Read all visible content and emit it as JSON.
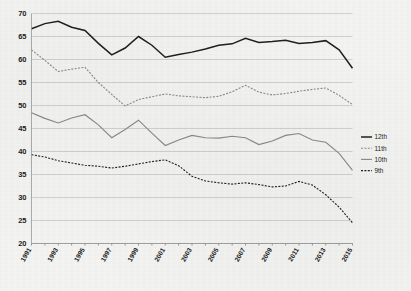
{
  "chart_data": {
    "type": "line",
    "title": "",
    "subtitle": "",
    "xlabel": "",
    "ylabel": "",
    "xlim": [
      1991,
      2015
    ],
    "ylim": [
      20,
      70
    ],
    "yticks": [
      20,
      25,
      30,
      35,
      40,
      45,
      50,
      55,
      60,
      65,
      70
    ],
    "grid": true,
    "legend_position": "right",
    "x": [
      1991,
      1992,
      1993,
      1994,
      1995,
      1996,
      1997,
      1998,
      1999,
      2000,
      2001,
      2002,
      2003,
      2004,
      2005,
      2006,
      2007,
      2008,
      2009,
      2010,
      2011,
      2012,
      2013,
      2014,
      2015
    ],
    "xtick_labels": [
      "1991",
      "1993",
      "1995",
      "1997",
      "1999",
      "2001",
      "2003",
      "2005",
      "2007",
      "2009",
      "2011",
      "2013",
      "2015"
    ],
    "xticks": [
      1991,
      1993,
      1995,
      1997,
      1999,
      2001,
      2003,
      2005,
      2007,
      2009,
      2011,
      2013,
      2015
    ],
    "series": [
      {
        "name": "12th",
        "style": "solid",
        "color": "#1f1f1f",
        "width": 1.5,
        "values": [
          66.7,
          67.8,
          68.3,
          67.0,
          66.3,
          63.5,
          61.0,
          62.5,
          65.0,
          63.1,
          60.5,
          61.1,
          61.6,
          62.3,
          63.1,
          63.4,
          64.6,
          63.7,
          63.9,
          64.2,
          63.5,
          63.7,
          64.1,
          62.1,
          58.1
        ]
      },
      {
        "name": "11th",
        "style": "dashed",
        "color": "#8a8a8a",
        "width": 1.1,
        "values": [
          62.1,
          59.8,
          57.4,
          57.9,
          58.3,
          55.0,
          52.4,
          49.9,
          51.3,
          51.9,
          52.5,
          52.1,
          51.9,
          51.7,
          52.0,
          53.0,
          54.4,
          52.9,
          52.3,
          52.6,
          53.1,
          53.5,
          53.8,
          52.2,
          50.2
        ]
      },
      {
        "name": "10th",
        "style": "solid",
        "color": "#8a8a8a",
        "width": 1.1,
        "values": [
          48.4,
          47.2,
          46.2,
          47.3,
          48.0,
          45.8,
          43.0,
          44.8,
          46.8,
          44.0,
          41.3,
          42.5,
          43.5,
          43.0,
          42.9,
          43.3,
          43.0,
          41.5,
          42.3,
          43.5,
          43.9,
          42.5,
          42.0,
          39.6,
          35.9
        ]
      },
      {
        "name": "9th",
        "style": "dashed",
        "color": "#1f1f1f",
        "width": 1.1,
        "values": [
          39.3,
          38.8,
          38.0,
          37.5,
          37.0,
          36.8,
          36.4,
          36.8,
          37.3,
          37.8,
          38.2,
          36.9,
          34.6,
          33.6,
          33.2,
          32.9,
          33.2,
          32.8,
          32.3,
          32.5,
          33.5,
          32.7,
          30.6,
          27.9,
          24.5
        ]
      }
    ]
  },
  "legend": {
    "items": [
      {
        "label": "12th"
      },
      {
        "label": "11th"
      },
      {
        "label": "10th"
      },
      {
        "label": "9th"
      }
    ]
  }
}
